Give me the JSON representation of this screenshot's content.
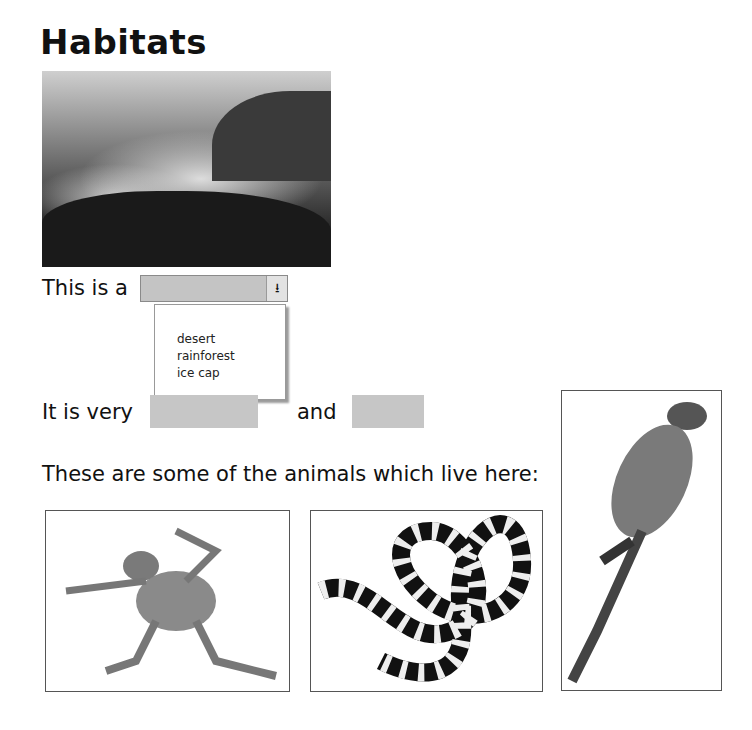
{
  "page": {
    "title": "Habitats",
    "hero_image": "misty rainforest valley photo",
    "sentence1": {
      "prefix": "This is a",
      "dropdown": {
        "selected": "",
        "options": [
          "desert",
          "rainforest",
          "ice cap"
        ]
      }
    },
    "sentence2": {
      "prefix": "It is very",
      "conjunction": "and"
    },
    "animals_heading": "These are some of the animals which live here:",
    "animals": [
      {
        "name": "frog",
        "label": "frog photo"
      },
      {
        "name": "snake",
        "label": "banded snake photo"
      },
      {
        "name": "macaw",
        "label": "macaw parrot photo"
      }
    ]
  }
}
